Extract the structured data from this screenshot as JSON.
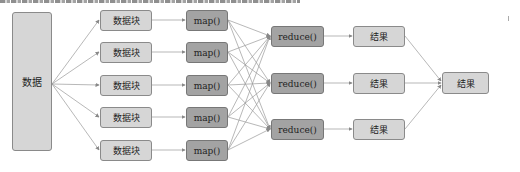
{
  "diagram": {
    "type": "mapreduce-flow",
    "source": {
      "label": "数据"
    },
    "chunks": [
      {
        "label": "数据块"
      },
      {
        "label": "数据块"
      },
      {
        "label": "数据块"
      },
      {
        "label": "数据块"
      },
      {
        "label": "数据块"
      }
    ],
    "maps": [
      {
        "label": "map()"
      },
      {
        "label": "map()"
      },
      {
        "label": "map()"
      },
      {
        "label": "map()"
      },
      {
        "label": "map()"
      }
    ],
    "reduces": [
      {
        "label": "reduce()"
      },
      {
        "label": "reduce()"
      },
      {
        "label": "reduce()"
      }
    ],
    "partial_results": [
      {
        "label": "结果"
      },
      {
        "label": "结果"
      },
      {
        "label": "结果"
      }
    ],
    "final_result": {
      "label": "结果"
    },
    "colors": {
      "light_box": "#d6d6d6",
      "dark_box": "#a3a3a3",
      "border": "#8a8a8a",
      "edge": "#888888"
    }
  }
}
